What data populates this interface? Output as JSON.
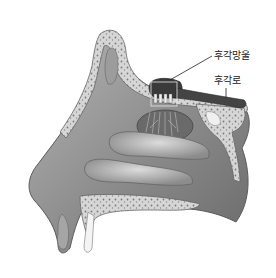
{
  "figure": {
    "labels": [
      {
        "id": "olfactory-bulb",
        "text": "후각망울"
      },
      {
        "id": "olfactory-tract",
        "text": "후각로"
      }
    ],
    "colors": {
      "background": "#ffffff",
      "skin": "#9a9a9a",
      "skin_dark": "#6e6e6e",
      "bone": "#d8d8d8",
      "bone_speckle": "#7a7a7a",
      "bulb": "#3a3a3a",
      "turbinate": "#bdbdbd",
      "line": "#222222"
    }
  }
}
